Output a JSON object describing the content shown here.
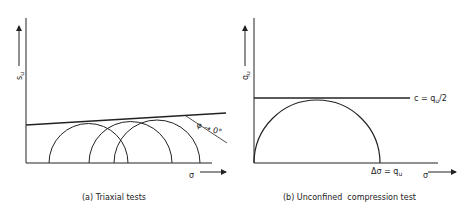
{
  "panels": [
    {
      "id": "a",
      "caption": "(a) Triaxial tests",
      "y_axis_label": "s",
      "y_axis_subscript": "u",
      "x_axis_label": "σ",
      "annotation": "φ → 0°",
      "elements": [
        "three Mohr circles",
        "nearly horizontal failure envelope",
        "angle line"
      ]
    },
    {
      "id": "b",
      "caption": "(b) Unconfined  compression test",
      "y_axis_label": "q",
      "y_axis_subscript": "u",
      "x_axis_label": "σ",
      "envelope_label": "c = q",
      "envelope_label_sub": "u",
      "envelope_label_tail": "/2",
      "diameter_label": "Δσ = q",
      "diameter_label_sub": "u",
      "elements": [
        "single Mohr circle from origin",
        "horizontal envelope"
      ]
    }
  ]
}
